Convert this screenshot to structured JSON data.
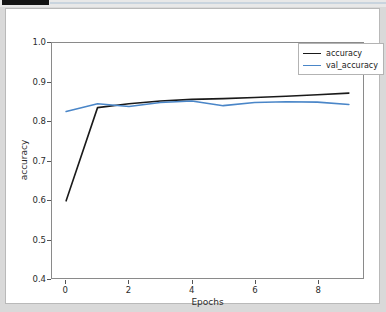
{
  "window": {
    "background_color": "#d9d9d9",
    "card_background": "#ffffff"
  },
  "chart_data": {
    "type": "line",
    "title": "",
    "xlabel": "Epochs",
    "ylabel": "accuracy",
    "x": [
      0,
      1,
      2,
      3,
      4,
      5,
      6,
      7,
      8,
      9
    ],
    "xlim": [
      -0.45,
      9.45
    ],
    "ylim": [
      0.4,
      1.0
    ],
    "xticks": [
      0,
      2,
      4,
      6,
      8
    ],
    "xticklabels": [
      "0",
      "2",
      "4",
      "6",
      "8"
    ],
    "yticks": [
      0.4,
      0.5,
      0.6,
      0.7,
      0.8,
      0.9,
      1.0
    ],
    "yticklabels": [
      "0.4",
      "0.5",
      "0.6",
      "0.7",
      "0.8",
      "0.9",
      "1.0"
    ],
    "grid": false,
    "legend_position": "upper right",
    "series": [
      {
        "name": "accuracy",
        "color": "#1a1a1a",
        "values": [
          0.597,
          0.835,
          0.845,
          0.852,
          0.856,
          0.858,
          0.861,
          0.864,
          0.868,
          0.872
        ]
      },
      {
        "name": "val_accuracy",
        "color": "#4a86c8",
        "values": [
          0.825,
          0.845,
          0.838,
          0.848,
          0.852,
          0.84,
          0.848,
          0.85,
          0.849,
          0.843
        ]
      }
    ]
  },
  "legend": {
    "entries": [
      {
        "label": "accuracy",
        "color": "#1a1a1a"
      },
      {
        "label": "val_accuracy",
        "color": "#4a86c8"
      }
    ]
  }
}
